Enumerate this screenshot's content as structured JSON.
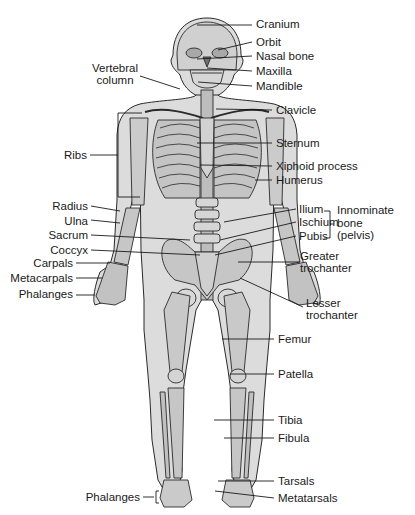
{
  "colors": {
    "body_fill": "#dcdcdc",
    "bone_fill": "#c8c8c8",
    "outline": "#2a2a2a",
    "label_text": "#1a1a1a",
    "leader_line": "#1a1a1a"
  },
  "labels": {
    "right_side": [
      {
        "id": "cranium",
        "text": "Cranium"
      },
      {
        "id": "orbit",
        "text": "Orbit"
      },
      {
        "id": "nasal_bone",
        "text": "Nasal bone"
      },
      {
        "id": "maxilla",
        "text": "Maxilla"
      },
      {
        "id": "mandible",
        "text": "Mandible"
      },
      {
        "id": "clavicle",
        "text": "Clavicle"
      },
      {
        "id": "sternum",
        "text": "Sternum"
      },
      {
        "id": "xiphoid_process",
        "text": "Xiphoid process"
      },
      {
        "id": "humerus",
        "text": "Humerus"
      },
      {
        "id": "ilium",
        "text": "Ilium"
      },
      {
        "id": "ischium",
        "text": "Ischium"
      },
      {
        "id": "pubis",
        "text": "Pubis"
      },
      {
        "id": "greater_trochanter",
        "text": "Greater\ntrochanter"
      },
      {
        "id": "lesser_trochanter",
        "text": "Lesser\ntrochanter"
      },
      {
        "id": "femur",
        "text": "Femur"
      },
      {
        "id": "patella",
        "text": "Patella"
      },
      {
        "id": "tibia",
        "text": "Tibia"
      },
      {
        "id": "fibula",
        "text": "Fibula"
      },
      {
        "id": "tarsals",
        "text": "Tarsals"
      },
      {
        "id": "metatarsals",
        "text": "Metatarsals"
      }
    ],
    "left_side": [
      {
        "id": "vertebral_column",
        "text": "Vertebral\ncolumn"
      },
      {
        "id": "ribs",
        "text": "Ribs"
      },
      {
        "id": "radius",
        "text": "Radius"
      },
      {
        "id": "ulna",
        "text": "Ulna"
      },
      {
        "id": "sacrum",
        "text": "Sacrum"
      },
      {
        "id": "coccyx",
        "text": "Coccyx"
      },
      {
        "id": "carpals",
        "text": "Carpals"
      },
      {
        "id": "metacarpals",
        "text": "Metacarpals"
      },
      {
        "id": "phalanges_hand",
        "text": "Phalanges"
      },
      {
        "id": "phalanges_foot",
        "text": "Phalanges"
      }
    ],
    "group": {
      "id": "innominate_bone",
      "text": "Innominate\nbone\n(pelvis)"
    }
  }
}
